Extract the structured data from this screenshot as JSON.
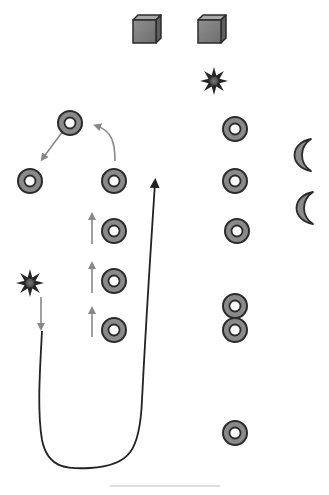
{
  "diagram": {
    "width": 329,
    "height": 495,
    "colors": {
      "stroke_dark": "#2b2b2b",
      "fill_gray": "#8a8a8a",
      "arrow_gray": "#888888",
      "line_light": "#bbbbbb",
      "background": "#ffffff"
    },
    "cubes": [
      {
        "id": "cube-1",
        "x": 147,
        "y": 29
      },
      {
        "id": "cube-2",
        "x": 212,
        "y": 29
      }
    ],
    "stars": [
      {
        "id": "star-top-right",
        "x": 214,
        "y": 81
      },
      {
        "id": "star-left",
        "x": 30,
        "y": 283
      }
    ],
    "rings": [
      {
        "id": "ring-top-apex",
        "x": 70,
        "y": 123
      },
      {
        "id": "ring-left",
        "x": 30,
        "y": 181
      },
      {
        "id": "ring-middle-top",
        "x": 114,
        "y": 181
      },
      {
        "id": "ring-middle-2",
        "x": 114,
        "y": 231
      },
      {
        "id": "ring-middle-3",
        "x": 114,
        "y": 281
      },
      {
        "id": "ring-middle-4",
        "x": 114,
        "y": 330
      },
      {
        "id": "ring-right-1",
        "x": 235,
        "y": 129
      },
      {
        "id": "ring-right-2",
        "x": 235,
        "y": 181
      },
      {
        "id": "ring-right-3",
        "x": 237,
        "y": 231
      },
      {
        "id": "ring-right-4a",
        "x": 235,
        "y": 306
      },
      {
        "id": "ring-right-4b",
        "x": 235,
        "y": 330
      },
      {
        "id": "ring-right-bottom",
        "x": 235,
        "y": 433
      }
    ],
    "moons": [
      {
        "id": "moon-1",
        "x": 303,
        "y": 155
      },
      {
        "id": "moon-2",
        "x": 305,
        "y": 208
      }
    ],
    "gray_arrows": [
      {
        "id": "arrow-apex-to-left",
        "d": "M 63 131 L 43 158"
      },
      {
        "id": "arrow-middle-to-apex",
        "d": "M 115 161 C 115 143, 112 131, 97 126"
      },
      {
        "id": "arrow-up-1",
        "d": "M 92 244 L 92 216"
      },
      {
        "id": "arrow-up-2",
        "d": "M 92 293 L 92 265"
      },
      {
        "id": "arrow-up-3",
        "d": "M 92 337 L 92 310"
      },
      {
        "id": "arrow-star-down",
        "d": "M 41 297 L 41 327"
      }
    ],
    "black_path": {
      "id": "loop-path",
      "d": "M 42 331 C 40 370, 37 410, 42 440 C 48 470, 70 469, 90 468 C 130 466, 140 450, 142 400 C 146 320, 150 260, 155 183"
    },
    "baseline": {
      "x1": 110,
      "y1": 486,
      "x2": 220,
      "y2": 486
    }
  }
}
